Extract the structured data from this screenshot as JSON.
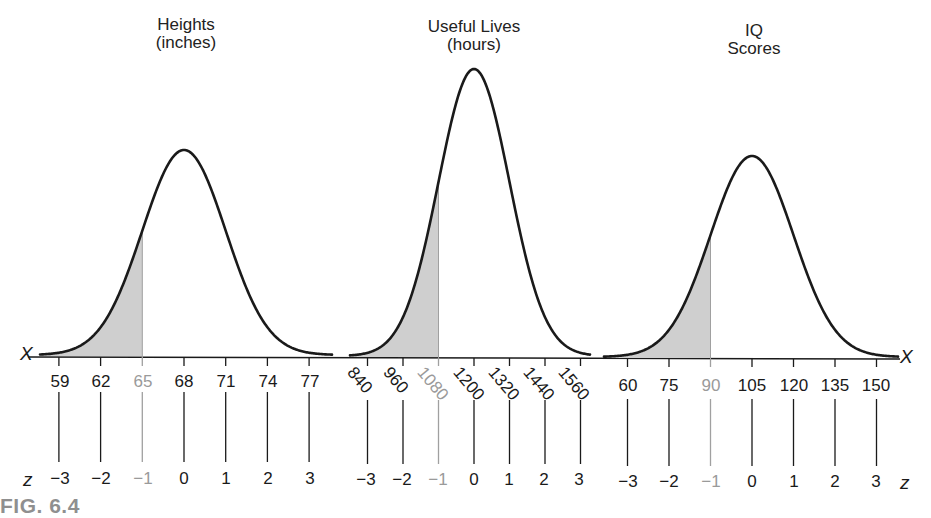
{
  "figure": {
    "label": "FIG. 6.4",
    "axis_symbols": {
      "x": "X",
      "z": "z"
    },
    "colors": {
      "curve": "#1a1a1a",
      "shade": "#cfcfcf",
      "highlight_text": "#9a9a9a",
      "fig_label": "#8f8f8f"
    }
  },
  "panels": [
    {
      "title_line1": "Heights",
      "title_line2": "(inches)",
      "x_ticks": [
        "59",
        "62",
        "65",
        "68",
        "71",
        "74",
        "77"
      ],
      "z_ticks": [
        "−3",
        "−2",
        "−1",
        "0",
        "1",
        "2",
        "3"
      ]
    },
    {
      "title_line1": "Useful Lives",
      "title_line2": "(hours)",
      "x_ticks": [
        "840",
        "960",
        "1080",
        "1200",
        "1320",
        "1440",
        "1560"
      ],
      "z_ticks": [
        "−3",
        "−2",
        "−1",
        "0",
        "1",
        "2",
        "3"
      ]
    },
    {
      "title_line1": "IQ",
      "title_line2": "Scores",
      "x_ticks": [
        "60",
        "75",
        "90",
        "105",
        "120",
        "135",
        "150"
      ],
      "z_ticks": [
        "−3",
        "−2",
        "−1",
        "0",
        "1",
        "2",
        "3"
      ]
    }
  ],
  "chart_data": [
    {
      "type": "area",
      "title": "Heights (inches)",
      "distribution": "normal",
      "mean": 68,
      "sd": 3,
      "x": [
        59,
        62,
        65,
        68,
        71,
        74,
        77
      ],
      "z": [
        -3,
        -2,
        -1,
        0,
        1,
        2,
        3
      ],
      "shaded_region": {
        "from": "-inf",
        "to": 65,
        "z_to": -1
      },
      "xlabel": "X",
      "zlabel": "z",
      "grid": false
    },
    {
      "type": "area",
      "title": "Useful Lives (hours)",
      "distribution": "normal",
      "mean": 1200,
      "sd": 120,
      "x": [
        840,
        960,
        1080,
        1200,
        1320,
        1440,
        1560
      ],
      "z": [
        -3,
        -2,
        -1,
        0,
        1,
        2,
        3
      ],
      "shaded_region": {
        "from": "-inf",
        "to": 1080,
        "z_to": -1
      },
      "xlabel": "X",
      "zlabel": "z",
      "grid": false
    },
    {
      "type": "area",
      "title": "IQ Scores",
      "distribution": "normal",
      "mean": 105,
      "sd": 15,
      "x": [
        60,
        75,
        90,
        105,
        120,
        135,
        150
      ],
      "z": [
        -3,
        -2,
        -1,
        0,
        1,
        2,
        3
      ],
      "shaded_region": {
        "from": "-inf",
        "to": 90,
        "z_to": -1
      },
      "xlabel": "X",
      "zlabel": "z",
      "grid": false
    }
  ]
}
